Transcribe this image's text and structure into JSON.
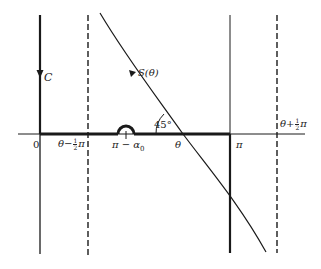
{
  "diagram": {
    "contour_label": "C",
    "curve_label": "S(θ)",
    "angle_label": "45°",
    "axis_labels": {
      "origin": "0",
      "left_dashed": {
        "prefix": "θ−",
        "num": "1",
        "den": "2",
        "suffix": "π"
      },
      "indent": "π − α",
      "indent_sub": "0",
      "crossing": "θ",
      "pi": "π",
      "right_dashed": {
        "prefix": "θ+",
        "num": "1",
        "den": "2",
        "suffix": "π"
      }
    },
    "colors": {
      "ink": "#1a1a1a",
      "background": "#ffffff"
    }
  }
}
